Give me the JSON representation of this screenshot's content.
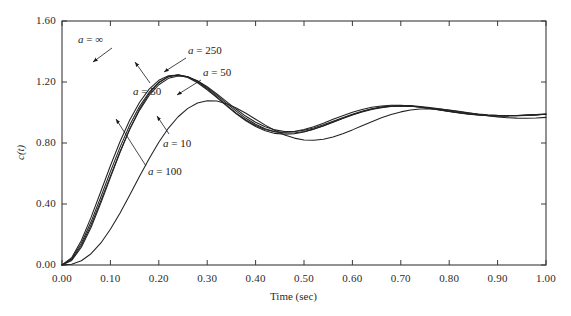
{
  "chart_data": {
    "type": "line",
    "title": "",
    "xlabel": "Time (sec)",
    "ylabel": "c(t)",
    "xlim": [
      0.0,
      1.0
    ],
    "ylim": [
      0.0,
      1.6
    ],
    "grid": false,
    "legend_position": "inline-annotations",
    "xticks": [
      "0.00",
      "0.10",
      "0.20",
      "0.30",
      "0.40",
      "0.50",
      "0.60",
      "0.70",
      "0.80",
      "0.90",
      "1.00"
    ],
    "xtick_values": [
      0.0,
      0.1,
      0.2,
      0.3,
      0.4,
      0.5,
      0.6,
      0.7,
      0.8,
      0.9,
      1.0
    ],
    "yticks": [
      "0.00",
      "0.40",
      "0.80",
      "1.20",
      "1.60"
    ],
    "ytick_values": [
      0.0,
      0.4,
      0.8,
      1.2,
      1.6
    ],
    "x": [
      0.0,
      0.02,
      0.04,
      0.06,
      0.08,
      0.1,
      0.12,
      0.14,
      0.16,
      0.18,
      0.2,
      0.22,
      0.24,
      0.26,
      0.28,
      0.3,
      0.32,
      0.34,
      0.36,
      0.38,
      0.4,
      0.42,
      0.44,
      0.46,
      0.48,
      0.5,
      0.52,
      0.54,
      0.56,
      0.58,
      0.6,
      0.62,
      0.64,
      0.66,
      0.68,
      0.7,
      0.72,
      0.74,
      0.76,
      0.78,
      0.8,
      0.82,
      0.84,
      0.86,
      0.88,
      0.9,
      0.92,
      0.94,
      0.96,
      0.98,
      1.0
    ],
    "series": [
      {
        "name": "a = ∞",
        "label_value": "∞",
        "color": "#222222",
        "values": [
          0.0,
          0.035,
          0.128,
          0.262,
          0.418,
          0.583,
          0.744,
          0.89,
          1.014,
          1.112,
          1.182,
          1.224,
          1.24,
          1.233,
          1.208,
          1.169,
          1.122,
          1.071,
          1.021,
          0.975,
          0.936,
          0.906,
          0.886,
          0.876,
          0.876,
          0.884,
          0.899,
          0.919,
          0.942,
          0.965,
          0.988,
          1.008,
          1.024,
          1.036,
          1.043,
          1.046,
          1.045,
          1.04,
          1.033,
          1.024,
          1.015,
          1.005,
          0.997,
          0.99,
          0.985,
          0.982,
          0.981,
          0.981,
          0.983,
          0.986,
          0.989
        ]
      },
      {
        "name": "a = 250",
        "label_value": "250",
        "color": "#222222",
        "values": [
          0.0,
          0.041,
          0.142,
          0.283,
          0.444,
          0.612,
          0.773,
          0.918,
          1.039,
          1.133,
          1.198,
          1.235,
          1.246,
          1.234,
          1.205,
          1.163,
          1.113,
          1.06,
          1.009,
          0.962,
          0.923,
          0.893,
          0.874,
          0.865,
          0.866,
          0.875,
          0.891,
          0.912,
          0.936,
          0.96,
          0.983,
          1.003,
          1.02,
          1.032,
          1.039,
          1.042,
          1.041,
          1.036,
          1.028,
          1.019,
          1.009,
          1.0,
          0.992,
          0.985,
          0.981,
          0.978,
          0.978,
          0.979,
          0.981,
          0.984,
          0.988
        ]
      },
      {
        "name": "a = 100",
        "label_value": "100",
        "color": "#222222",
        "values": [
          0.0,
          0.048,
          0.161,
          0.312,
          0.48,
          0.651,
          0.81,
          0.951,
          1.066,
          1.153,
          1.211,
          1.241,
          1.246,
          1.229,
          1.195,
          1.149,
          1.097,
          1.043,
          0.992,
          0.946,
          0.908,
          0.88,
          0.863,
          0.857,
          0.86,
          0.872,
          0.89,
          0.913,
          0.938,
          0.963,
          0.986,
          1.007,
          1.023,
          1.035,
          1.041,
          1.043,
          1.041,
          1.035,
          1.027,
          1.017,
          1.007,
          0.998,
          0.99,
          0.984,
          0.98,
          0.978,
          0.978,
          0.979,
          0.982,
          0.985,
          0.988
        ]
      },
      {
        "name": "a = 50",
        "label_value": "50",
        "color": "#222222",
        "values": [
          0.0,
          0.03,
          0.116,
          0.246,
          0.404,
          0.573,
          0.739,
          0.892,
          1.022,
          1.124,
          1.195,
          1.235,
          1.247,
          1.234,
          1.202,
          1.156,
          1.103,
          1.048,
          0.996,
          0.951,
          0.915,
          0.889,
          0.874,
          0.87,
          0.875,
          0.888,
          0.907,
          0.93,
          0.955,
          0.979,
          1.001,
          1.019,
          1.034,
          1.043,
          1.047,
          1.047,
          1.043,
          1.036,
          1.027,
          1.016,
          1.006,
          0.997,
          0.989,
          0.983,
          0.979,
          0.978,
          0.978,
          0.98,
          0.983,
          0.986,
          0.99
        ]
      },
      {
        "name": "a = 10",
        "label_value": "10",
        "color": "#222222",
        "values": [
          0.0,
          0.005,
          0.028,
          0.074,
          0.143,
          0.234,
          0.341,
          0.459,
          0.58,
          0.697,
          0.805,
          0.898,
          0.972,
          1.027,
          1.062,
          1.077,
          1.075,
          1.058,
          1.03,
          0.995,
          0.956,
          0.917,
          0.882,
          0.853,
          0.832,
          0.82,
          0.818,
          0.825,
          0.84,
          0.861,
          0.886,
          0.913,
          0.94,
          0.965,
          0.987,
          1.004,
          1.016,
          1.023,
          1.025,
          1.023,
          1.017,
          1.008,
          0.998,
          0.988,
          0.979,
          0.971,
          0.966,
          0.963,
          0.962,
          0.964,
          0.968
        ]
      }
    ],
    "annotations": [
      {
        "id": "annot-a-infinity",
        "text": "a = ∞",
        "var": "a",
        "rest": " = ∞",
        "label_x": 78,
        "label_y": 33,
        "arrow": {
          "x1": 112,
          "y1": 48,
          "x2": 93,
          "y2": 62
        }
      },
      {
        "id": "annot-a-250",
        "text": "a = 250",
        "var": "a",
        "rest": " = 250",
        "label_x": 188,
        "label_y": 44,
        "arrow": {
          "x1": 186,
          "y1": 58,
          "x2": 164,
          "y2": 72
        }
      },
      {
        "id": "annot-a-50-right",
        "text": "a = 50",
        "var": "a",
        "rest": " = 50",
        "label_x": 203,
        "label_y": 66,
        "arrow": {
          "x1": 201,
          "y1": 80,
          "x2": 177,
          "y2": 95
        }
      },
      {
        "id": "annot-a-50-left",
        "text": "a = 50",
        "var": "a",
        "rest": " = 50",
        "label_x": 133,
        "label_y": 85,
        "arrow": {
          "x1": 150,
          "y1": 83,
          "x2": 135,
          "y2": 62
        }
      },
      {
        "id": "annot-a-10",
        "text": "a = 10",
        "var": "a",
        "rest": " = 10",
        "label_x": 163,
        "label_y": 137,
        "arrow": {
          "x1": 169,
          "y1": 134,
          "x2": 157,
          "y2": 116
        }
      },
      {
        "id": "annot-a-100",
        "text": "a = 100",
        "var": "a",
        "rest": " = 100",
        "label_x": 148,
        "label_y": 165,
        "arrow": {
          "x1": 146,
          "y1": 166,
          "x2": 116,
          "y2": 119
        }
      }
    ]
  }
}
